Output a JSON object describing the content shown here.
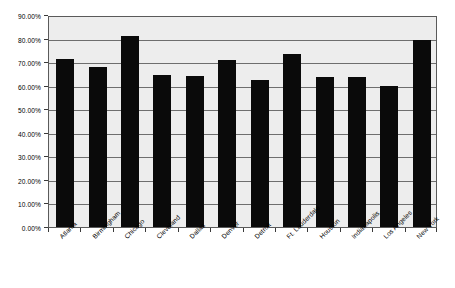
{
  "chart_data": {
    "type": "bar",
    "title": "",
    "subtitle": "",
    "xlabel": "",
    "ylabel": "",
    "categories": [
      "Atlanta",
      "Birmingham",
      "Chicago",
      "Cleveland",
      "Dallas",
      "Denver",
      "Detroit",
      "Ft. Lauderdale",
      "Houston",
      "Indianapolis",
      "Los Angeles",
      "New York"
    ],
    "values": [
      71.5,
      68.0,
      81.0,
      64.5,
      64.0,
      71.0,
      62.5,
      73.5,
      63.5,
      63.5,
      60.0,
      79.5
    ],
    "ylim": [
      0,
      90
    ],
    "ytick_step": 10,
    "ytick_labels": [
      "0.00%",
      "10.00%",
      "20.00%",
      "30.00%",
      "40.00%",
      "50.00%",
      "60.00%",
      "70.00%",
      "80.00%",
      "90.00%"
    ],
    "ytick_values": [
      0,
      10,
      20,
      30,
      40,
      50,
      60,
      70,
      80,
      90
    ],
    "grid": true,
    "grid_axis": "y",
    "legend": false,
    "legend_position": "none",
    "bar_color": "#0a0a0a",
    "plot_background": "#ededed",
    "grid_color": "#6e6e6e",
    "axis_color": "#5a5a5a",
    "page_background": "#ffffff",
    "xtick_label_rotation": -45
  }
}
